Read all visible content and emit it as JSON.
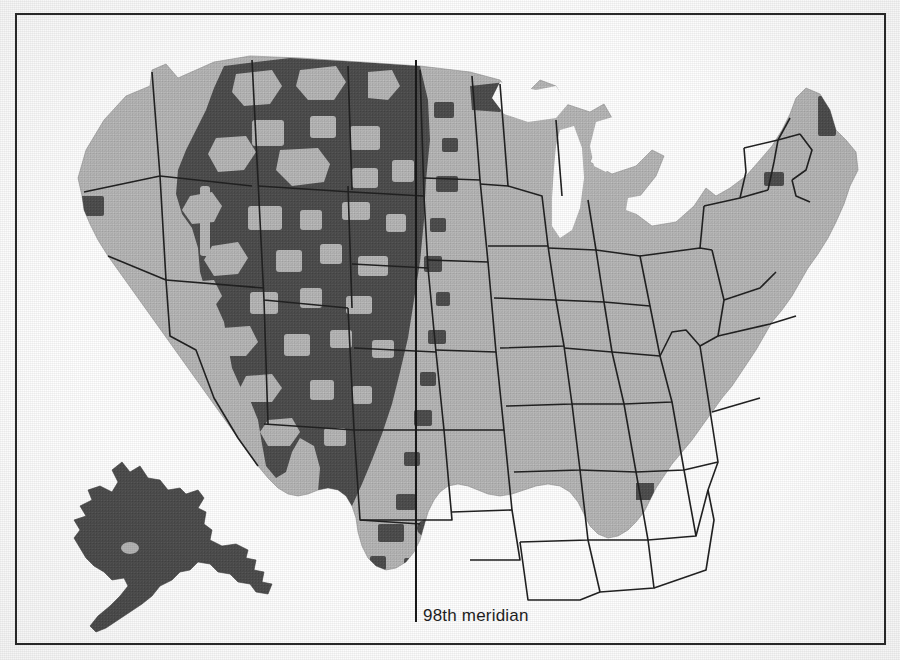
{
  "figure": {
    "kind": "thematic-map",
    "width": 900,
    "height": 660,
    "background_color": "#ffffff",
    "frame": {
      "border_color": "#2b2b2b",
      "border_width": 2,
      "x": 15,
      "y": 13,
      "width": 871,
      "height": 632
    }
  },
  "colors": {
    "land_light": "#b6b6b6",
    "land_dark": "#4e4e4e",
    "outline": "#1a1a1a",
    "state_border": "#222222",
    "water": "#ffffff",
    "text": "#1f1f1f"
  },
  "annotations": {
    "meridian": {
      "label": "98th meridian",
      "label_x": 423,
      "label_y": 607,
      "line_x": 416,
      "line_y_top": 60,
      "line_y_bottom": 622,
      "line_color": "#1a1a1a",
      "line_width": 2
    }
  },
  "insets": [
    {
      "name": "alaska-inset",
      "shading": "dark",
      "x": 45,
      "y": 478,
      "width": 175,
      "height": 155
    }
  ],
  "legend_implied": {
    "dark_meaning": "shaded counties (west of / near the 98th meridian)",
    "light_meaning": "unshaded counties"
  },
  "chart_data": {
    "type": "map",
    "title": "",
    "categories": [
      "dark-shaded counties",
      "light-unshaded counties"
    ],
    "regions": [
      {
        "name": "western-interior",
        "shading": "dark"
      },
      {
        "name": "great-plains",
        "shading": "dark"
      },
      {
        "name": "pacific-coast",
        "shading": "light"
      },
      {
        "name": "midwest",
        "shading": "light"
      },
      {
        "name": "southeast",
        "shading": "light"
      },
      {
        "name": "northeast",
        "shading": "light"
      },
      {
        "name": "alaska",
        "shading": "dark"
      }
    ],
    "outlier_dark_patches_east": [
      "northern-minnesota",
      "northern-maine",
      "central-new-york",
      "florida-panhandle",
      "south-alabama"
    ]
  }
}
